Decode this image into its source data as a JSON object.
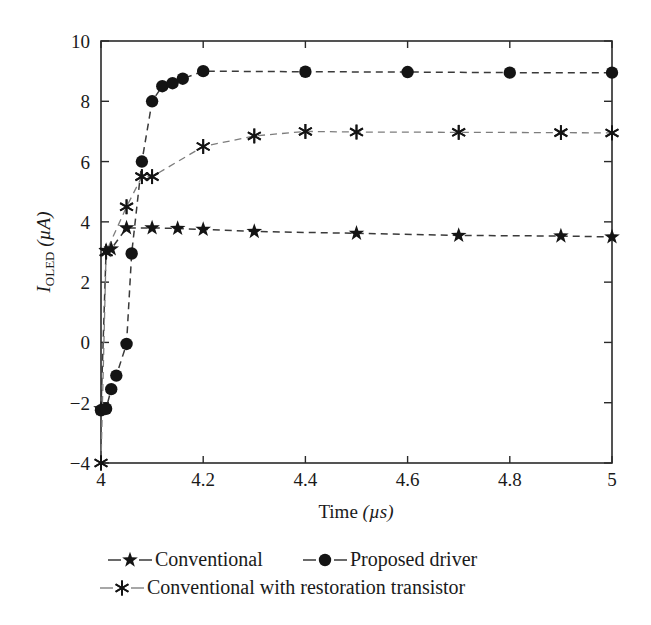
{
  "chart_data": {
    "type": "line",
    "title": "",
    "xlabel": "Time (µs)",
    "ylabel": "I_OLED (µA)",
    "ylabel_parts": {
      "italic": "I",
      "subscript": "OLED",
      "unit": "(µA)"
    },
    "xlabel_parts": {
      "text": "Time",
      "unit": "(µs)"
    },
    "xlim": [
      4,
      5
    ],
    "ylim": [
      -4,
      10
    ],
    "xticks": [
      4,
      4.2,
      4.4,
      4.6,
      4.8,
      5
    ],
    "xticklabels": [
      "4",
      "4.2",
      "4.4",
      "4.6",
      "4.8",
      "5"
    ],
    "yticks": [
      -4,
      -2,
      0,
      2,
      4,
      6,
      8,
      10
    ],
    "yticklabels": [
      "−4",
      "−2",
      "0",
      "2",
      "4",
      "6",
      "8",
      "10"
    ],
    "grid": false,
    "legend_position": "below-axes",
    "linestyle": "dashed",
    "series": [
      {
        "name": "Conventional",
        "marker": "star",
        "color": "#141414",
        "line_color": "#3a3a3a",
        "x": [
          4.0,
          4.01,
          4.02,
          4.05,
          4.1,
          4.15,
          4.2,
          4.3,
          4.5,
          4.7,
          4.9,
          5.0
        ],
        "values": [
          -2.2,
          3.05,
          3.1,
          3.8,
          3.8,
          3.78,
          3.75,
          3.68,
          3.62,
          3.55,
          3.53,
          3.5
        ]
      },
      {
        "name": "Proposed driver",
        "marker": "circle",
        "color": "#141414",
        "line_color": "#3a3a3a",
        "x": [
          4.0,
          4.01,
          4.02,
          4.03,
          4.05,
          4.06,
          4.08,
          4.1,
          4.12,
          4.14,
          4.16,
          4.2,
          4.4,
          4.6,
          4.8,
          5.0
        ],
        "values": [
          -2.25,
          -2.2,
          -1.55,
          -1.1,
          -0.05,
          2.95,
          6.0,
          8.0,
          8.5,
          8.6,
          8.75,
          9.0,
          8.98,
          8.97,
          8.95,
          8.95
        ]
      },
      {
        "name": "Conventional with restoration transistor",
        "marker": "asterisk",
        "color": "#141414",
        "line_color": "#8a8a8a",
        "x": [
          4.0,
          4.01,
          4.05,
          4.08,
          4.1,
          4.2,
          4.3,
          4.4,
          4.5,
          4.7,
          4.9,
          5.0
        ],
        "values": [
          -4.0,
          3.0,
          4.5,
          5.5,
          5.5,
          6.5,
          6.85,
          7.0,
          6.98,
          6.97,
          6.96,
          6.95
        ]
      }
    ]
  },
  "legend": {
    "items": [
      {
        "label": "Conventional",
        "marker": "star"
      },
      {
        "label": "Proposed driver",
        "marker": "circle"
      },
      {
        "label": "Conventional with restoration transistor",
        "marker": "asterisk"
      }
    ]
  }
}
